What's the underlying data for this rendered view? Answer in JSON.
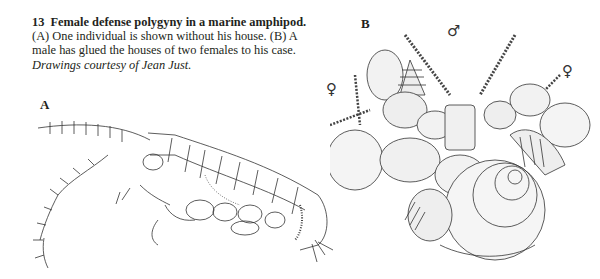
{
  "figure": {
    "number": "13",
    "title": "Female defense polygyny in a marine amphipod.",
    "description": "(A) One individual is shown without his house. (B) A male has glued the houses of two females to his case.",
    "credit": "Drawings courtesy of Jean Just."
  },
  "panels": [
    {
      "label": "A",
      "content": "amphipod-drawing-without-house"
    },
    {
      "label": "B",
      "content": "male-case-with-two-female-houses"
    }
  ],
  "symbols": {
    "male": "♂",
    "female_left": "♀",
    "female_right": "♀"
  }
}
